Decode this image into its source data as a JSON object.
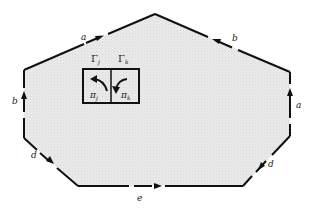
{
  "diagram": {
    "polygon": {
      "fill": "#e6e6e6",
      "stroke": "#111111",
      "vertices": [
        [
          155,
          14
        ],
        [
          290,
          72
        ],
        [
          290,
          136
        ],
        [
          243,
          186
        ],
        [
          78,
          186
        ],
        [
          24,
          138
        ],
        [
          24,
          70
        ]
      ]
    },
    "edges": [
      {
        "label": "a",
        "from": "upper-left",
        "to": "top",
        "direction": "toward-top"
      },
      {
        "label": "b",
        "from": "top",
        "to": "upper-right",
        "direction": "toward-top"
      },
      {
        "label": "a",
        "from": "lower-right",
        "to": "upper-right",
        "direction": "upward"
      },
      {
        "label": "d",
        "from": "upper-right-lower",
        "to": "bottom-right",
        "direction": "down-left"
      },
      {
        "label": "e",
        "from": "bottom-left",
        "to": "bottom-right",
        "direction": "rightward"
      },
      {
        "label": "d",
        "from": "lower-left",
        "to": "bottom-left",
        "direction": "down-right"
      },
      {
        "label": "b",
        "from": "lower-left",
        "to": "upper-left",
        "direction": "upward"
      }
    ],
    "labels": {
      "edge_a_top": "a",
      "edge_b_top": "b",
      "edge_a_right": "a",
      "edge_d_right": "d",
      "edge_e_bottom": "e",
      "edge_d_left": "d",
      "edge_b_left": "b"
    },
    "inner_box": {
      "gamma_j": "Γ",
      "gamma_j_sub": "j",
      "gamma_k": "Γ",
      "gamma_k_sub": "k",
      "pi_j": "π",
      "pi_j_sub": "j",
      "pi_k": "π",
      "pi_k_sub": "k"
    }
  }
}
